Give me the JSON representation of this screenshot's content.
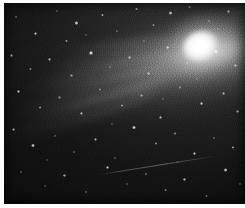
{
  "image": {
    "subject": "comet",
    "title": "Comet with bright coma and broad dust tail",
    "medium": "black-and-white astrophotograph",
    "orientation": "landscape",
    "width_px": 245,
    "height_px": 208,
    "border": {
      "color": "#ffffff",
      "left_px": 4,
      "top_px": 3,
      "right_px": 0,
      "bottom_px": 4
    },
    "palette": {
      "sky_dark": "#0b0b0b",
      "sky_mid": "#242424",
      "sky_light": "#3a3a3a",
      "tail_glow": "#bdbdbd",
      "coma_core": "#ffffff",
      "star": "#ffffff",
      "paper": "#ffffff"
    }
  },
  "features": {
    "coma": {
      "name": "comet-coma",
      "center_x_pct": 81.5,
      "center_y_pct": 21.5,
      "outer_w_pct": 30,
      "outer_h_pct": 30,
      "inner_w_pct": 15.5,
      "inner_h_pct": 15,
      "nucleus_w_pct": 7,
      "nucleus_h_pct": 6.5,
      "tilt_deg": -24
    },
    "tail": {
      "name": "comet-dust-tail",
      "direction": "upper-right to lower-left",
      "angle_deg": -15,
      "extends_to_edge": true
    },
    "tail_streaks": [
      {
        "left_pct": 6,
        "top_pct": 30,
        "w_pct": 74,
        "h_pct": 9,
        "rot_deg": -12,
        "opacity": 0.4
      },
      {
        "left_pct": 2,
        "top_pct": 38,
        "w_pct": 78,
        "h_pct": 11,
        "rot_deg": -15,
        "opacity": 0.34
      },
      {
        "left_pct": 14,
        "top_pct": 24,
        "w_pct": 64,
        "h_pct": 7,
        "rot_deg": -9,
        "opacity": 0.32
      },
      {
        "left_pct": 0,
        "top_pct": 47,
        "w_pct": 72,
        "h_pct": 12,
        "rot_deg": -18,
        "opacity": 0.24
      },
      {
        "left_pct": 20,
        "top_pct": 18,
        "w_pct": 58,
        "h_pct": 6,
        "rot_deg": -6,
        "opacity": 0.28
      }
    ],
    "satellite_trail": {
      "name": "satellite-trail",
      "left_pct": 40,
      "top_pct": 85,
      "length_pct": 48,
      "angle_deg": -9,
      "opacity": 0.5
    },
    "stars": [
      {
        "x": 5,
        "y": 7,
        "r": 1.0,
        "b": 0.55
      },
      {
        "x": 13,
        "y": 15,
        "r": 1.4,
        "b": 0.75
      },
      {
        "x": 22,
        "y": 4,
        "r": 1.0,
        "b": 0.5
      },
      {
        "x": 30,
        "y": 10,
        "r": 1.6,
        "b": 0.85
      },
      {
        "x": 26,
        "y": 19,
        "r": 1.1,
        "b": 0.6
      },
      {
        "x": 41,
        "y": 6,
        "r": 1.2,
        "b": 0.65
      },
      {
        "x": 47,
        "y": 14,
        "r": 1.0,
        "b": 0.52
      },
      {
        "x": 55,
        "y": 3,
        "r": 1.3,
        "b": 0.7
      },
      {
        "x": 62,
        "y": 11,
        "r": 1.0,
        "b": 0.48
      },
      {
        "x": 69,
        "y": 5,
        "r": 1.5,
        "b": 0.8
      },
      {
        "x": 77,
        "y": 2,
        "r": 1.1,
        "b": 0.58
      },
      {
        "x": 85,
        "y": 9,
        "r": 1.2,
        "b": 0.62
      },
      {
        "x": 93,
        "y": 4,
        "r": 1.4,
        "b": 0.72
      },
      {
        "x": 3,
        "y": 26,
        "r": 1.2,
        "b": 0.64
      },
      {
        "x": 11,
        "y": 33,
        "r": 1.0,
        "b": 0.5
      },
      {
        "x": 19,
        "y": 28,
        "r": 1.3,
        "b": 0.68
      },
      {
        "x": 28,
        "y": 36,
        "r": 1.1,
        "b": 0.55
      },
      {
        "x": 36,
        "y": 25,
        "r": 1.6,
        "b": 0.88
      },
      {
        "x": 44,
        "y": 32,
        "r": 1.0,
        "b": 0.46
      },
      {
        "x": 52,
        "y": 27,
        "r": 1.2,
        "b": 0.6
      },
      {
        "x": 60,
        "y": 35,
        "r": 1.1,
        "b": 0.54
      },
      {
        "x": 68,
        "y": 22,
        "r": 1.3,
        "b": 0.66
      },
      {
        "x": 76,
        "y": 30,
        "r": 1.0,
        "b": 0.44
      },
      {
        "x": 88,
        "y": 24,
        "r": 1.5,
        "b": 0.78
      },
      {
        "x": 96,
        "y": 31,
        "r": 1.2,
        "b": 0.62
      },
      {
        "x": 6,
        "y": 44,
        "r": 1.4,
        "b": 0.74
      },
      {
        "x": 15,
        "y": 52,
        "r": 1.1,
        "b": 0.56
      },
      {
        "x": 23,
        "y": 47,
        "r": 1.0,
        "b": 0.48
      },
      {
        "x": 32,
        "y": 55,
        "r": 1.3,
        "b": 0.68
      },
      {
        "x": 40,
        "y": 43,
        "r": 1.0,
        "b": 0.45
      },
      {
        "x": 49,
        "y": 51,
        "r": 1.2,
        "b": 0.58
      },
      {
        "x": 57,
        "y": 46,
        "r": 1.1,
        "b": 0.52
      },
      {
        "x": 65,
        "y": 57,
        "r": 1.4,
        "b": 0.72
      },
      {
        "x": 73,
        "y": 42,
        "r": 1.0,
        "b": 0.46
      },
      {
        "x": 82,
        "y": 50,
        "r": 1.5,
        "b": 0.82
      },
      {
        "x": 91,
        "y": 45,
        "r": 1.2,
        "b": 0.6
      },
      {
        "x": 97,
        "y": 54,
        "r": 1.3,
        "b": 0.66
      },
      {
        "x": 4,
        "y": 63,
        "r": 1.2,
        "b": 0.62
      },
      {
        "x": 12,
        "y": 71,
        "r": 1.5,
        "b": 0.8
      },
      {
        "x": 21,
        "y": 66,
        "r": 1.0,
        "b": 0.44
      },
      {
        "x": 29,
        "y": 74,
        "r": 1.1,
        "b": 0.52
      },
      {
        "x": 38,
        "y": 68,
        "r": 1.3,
        "b": 0.64
      },
      {
        "x": 46,
        "y": 77,
        "r": 1.0,
        "b": 0.46
      },
      {
        "x": 54,
        "y": 62,
        "r": 1.6,
        "b": 0.86
      },
      {
        "x": 63,
        "y": 70,
        "r": 1.1,
        "b": 0.54
      },
      {
        "x": 71,
        "y": 65,
        "r": 1.2,
        "b": 0.58
      },
      {
        "x": 79,
        "y": 75,
        "r": 1.4,
        "b": 0.74
      },
      {
        "x": 87,
        "y": 67,
        "r": 1.0,
        "b": 0.48
      },
      {
        "x": 95,
        "y": 72,
        "r": 1.3,
        "b": 0.68
      },
      {
        "x": 7,
        "y": 84,
        "r": 1.1,
        "b": 0.54
      },
      {
        "x": 17,
        "y": 91,
        "r": 1.0,
        "b": 0.46
      },
      {
        "x": 25,
        "y": 86,
        "r": 1.3,
        "b": 0.66
      },
      {
        "x": 34,
        "y": 94,
        "r": 1.2,
        "b": 0.58
      },
      {
        "x": 43,
        "y": 82,
        "r": 1.5,
        "b": 0.8
      },
      {
        "x": 51,
        "y": 90,
        "r": 1.0,
        "b": 0.44
      },
      {
        "x": 59,
        "y": 85,
        "r": 1.2,
        "b": 0.6
      },
      {
        "x": 67,
        "y": 93,
        "r": 1.1,
        "b": 0.5
      },
      {
        "x": 75,
        "y": 88,
        "r": 1.3,
        "b": 0.7
      },
      {
        "x": 84,
        "y": 96,
        "r": 1.0,
        "b": 0.46
      },
      {
        "x": 92,
        "y": 83,
        "r": 1.6,
        "b": 0.84
      },
      {
        "x": 98,
        "y": 90,
        "r": 1.2,
        "b": 0.62
      },
      {
        "x": 34,
        "y": 16,
        "r": 0.9,
        "b": 0.4
      },
      {
        "x": 58,
        "y": 19,
        "r": 0.9,
        "b": 0.38
      },
      {
        "x": 80,
        "y": 38,
        "r": 0.9,
        "b": 0.42
      },
      {
        "x": 66,
        "y": 48,
        "r": 0.9,
        "b": 0.4
      },
      {
        "x": 45,
        "y": 60,
        "r": 0.9,
        "b": 0.36
      },
      {
        "x": 18,
        "y": 78,
        "r": 0.9,
        "b": 0.38
      },
      {
        "x": 89,
        "y": 13,
        "r": 0.9,
        "b": 0.44
      },
      {
        "x": 72,
        "y": 79,
        "r": 0.9,
        "b": 0.4
      }
    ]
  }
}
